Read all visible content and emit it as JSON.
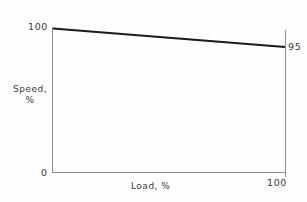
{
  "chart_data": {
    "type": "line",
    "title": "",
    "subtitle": "",
    "xlabel": "Load, %",
    "ylabel": "Speed,\n%",
    "ylabel_line1": "Speed,",
    "ylabel_line2": "%",
    "x": [
      0,
      100
    ],
    "series": [
      {
        "name": "speed-droop",
        "values": [
          100,
          95
        ],
        "color": "#1a1a1a"
      }
    ],
    "xlim": [
      0,
      100
    ],
    "ylim": [
      0,
      100
    ],
    "grid": false,
    "legend": false,
    "legend_position": "none",
    "axis_color": "#8c8c8c",
    "annotations": [
      {
        "name": "y-axis-max-label",
        "text": "100",
        "x": 0,
        "y": 100
      },
      {
        "name": "series-end-label",
        "text": "95",
        "x": 100,
        "y": 95
      },
      {
        "name": "origin-label",
        "text": "0",
        "x": 0,
        "y": 0
      },
      {
        "name": "x-axis-max-label",
        "text": "100",
        "x": 100,
        "y": 0
      }
    ],
    "xtick_labels": [
      "0",
      "100"
    ],
    "ytick_labels": [
      "0",
      "100"
    ]
  },
  "labels": {
    "y_max": "100",
    "series_end": "95",
    "origin": "0",
    "x_max": "100",
    "y_axis_line1": "Speed,",
    "y_axis_line2": "%",
    "x_axis": "Load, %"
  },
  "colors": {
    "background": "#fefefe",
    "axis": "#8c8c8c",
    "data_line": "#1a1a1a",
    "text": "#3a3a3a"
  }
}
